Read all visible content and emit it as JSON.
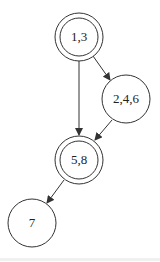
{
  "diagram": {
    "type": "directed-graph",
    "stroke_color": "#333333",
    "nodes": [
      {
        "id": "n13",
        "label": "1,3",
        "cx": 79,
        "cy": 37,
        "r": 24,
        "double": true
      },
      {
        "id": "n246",
        "label": "2,4,6",
        "cx": 126,
        "cy": 99,
        "r": 24,
        "double": false
      },
      {
        "id": "n58",
        "label": "5,8",
        "cx": 79,
        "cy": 160,
        "r": 24,
        "double": true
      },
      {
        "id": "n7",
        "label": "7",
        "cx": 32,
        "cy": 223,
        "r": 24,
        "double": false
      }
    ],
    "edges": [
      {
        "from": "1,3",
        "to": "2,4,6"
      },
      {
        "from": "1,3",
        "to": "5,8"
      },
      {
        "from": "2,4,6",
        "to": "5,8"
      },
      {
        "from": "5,8",
        "to": "7"
      }
    ]
  }
}
